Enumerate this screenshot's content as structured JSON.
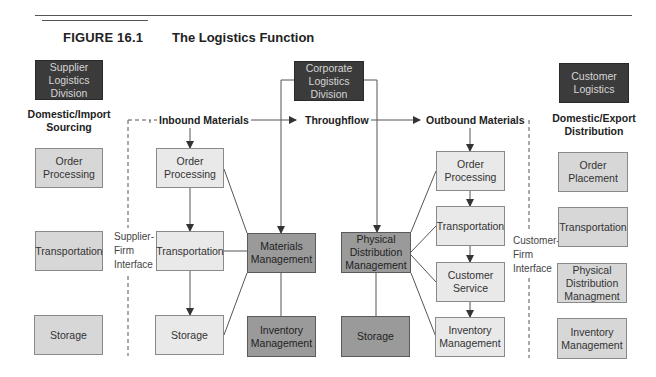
{
  "figure": {
    "number": "FIGURE 16.1",
    "title": "The Logistics Function"
  },
  "headers": {
    "supplier": "Supplier\nLogistics\nDivision",
    "corporate": "Corporate\nLogistics\nDivision",
    "customer": "Customer\nLogistics"
  },
  "section_labels": {
    "domestic_import": "Domestic/Import\nSourcing",
    "domestic_export": "Domestic/Export\nDistribution"
  },
  "flow_labels": {
    "inbound": "Inbound Materials",
    "throughflow": "Throughflow",
    "outbound": "Outbound Materials"
  },
  "interfaces": {
    "supplier_firm": "Supplier-\nFirm\nInterface",
    "customer_firm": "Customer-\nFirm\nInterface"
  },
  "supplier_column": [
    {
      "label": "Order\nProcessing"
    },
    {
      "label": "Transportation"
    },
    {
      "label": "Storage"
    }
  ],
  "inbound_column": [
    {
      "label": "Order\nProcessing"
    },
    {
      "label": "Transportation"
    },
    {
      "label": "Storage"
    }
  ],
  "materials": {
    "management": "Materials\nManagement",
    "inventory": "Inventory\nManagement"
  },
  "physical_distribution": {
    "management": "Physical\nDistribution\nManagement",
    "storage": "Storage"
  },
  "outbound_column": [
    {
      "label": "Order\nProcessing"
    },
    {
      "label": "Transportation"
    },
    {
      "label": "Customer\nService"
    },
    {
      "label": "Inventory\nManagement"
    }
  ],
  "customer_column": [
    {
      "label": "Order\nPlacement"
    },
    {
      "label": "Transportation"
    },
    {
      "label": "Physical\nDistribution\nManagment"
    },
    {
      "label": "Inventory\nManagement"
    }
  ],
  "colors": {
    "header_box": "#3b3b3b",
    "light_box": "#e9e9e9",
    "mid_box": "#d7d7d7",
    "dark_box": "#9a9a9a",
    "line": "#555555"
  }
}
